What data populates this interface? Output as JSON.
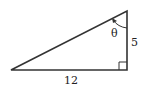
{
  "diagram": {
    "type": "right-triangle",
    "labels": {
      "base": "12",
      "height": "5",
      "angle": "θ"
    },
    "colors": {
      "stroke": "#333333",
      "background": "#ffffff"
    }
  }
}
